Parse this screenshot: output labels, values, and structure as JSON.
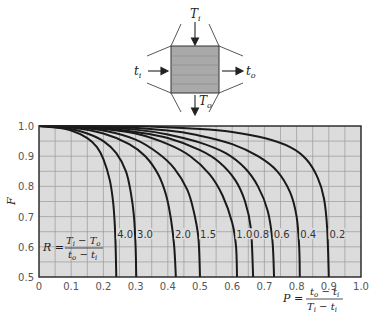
{
  "diagram": {
    "hot_in": "T",
    "hot_in_sub": "i",
    "hot_out": "T",
    "hot_out_sub": "o",
    "cold_in": "t",
    "cold_in_sub": "i",
    "cold_out": "t",
    "cold_out_sub": "o"
  },
  "formulas": {
    "R": {
      "lhs": "R =",
      "num": "T",
      "num_sub1": "i",
      "num_mid": " − T",
      "num_sub2": "o",
      "den": "t",
      "den_sub1": "o",
      "den_mid": " − t",
      "den_sub2": "i"
    },
    "P": {
      "lhs": "P =",
      "num": "t",
      "num_sub1": "o",
      "num_mid": " − t",
      "num_sub2": "i",
      "den": "T",
      "den_sub1": "i",
      "den_mid": " − t",
      "den_sub2": "i"
    }
  },
  "chart_data": {
    "type": "line",
    "title": "",
    "xlabel": "P = (t_o − t_i)/(T_i − t_i)",
    "ylabel": "F",
    "xlim": [
      0,
      1.0
    ],
    "ylim": [
      0.5,
      1.0
    ],
    "x_ticks": [
      "0",
      "0.1",
      "0.2",
      "0.3",
      "0.4",
      "0.5",
      "0.6",
      "0.7",
      "0.8",
      "0.9",
      "1.0"
    ],
    "y_ticks": [
      "1.0",
      "0.9",
      "0.8",
      "0.7",
      "0.6",
      "0.5"
    ],
    "grid": true,
    "grid_minor_x": 0.05,
    "grid_minor_y": 0.05,
    "legend_note": "Curves labeled by R = (T_i − T_o)/(t_o − t_i)",
    "series": [
      {
        "name": "4.0",
        "R": 4.0,
        "points": [
          [
            0,
            1.0
          ],
          [
            0.05,
            0.995
          ],
          [
            0.1,
            0.985
          ],
          [
            0.15,
            0.96
          ],
          [
            0.18,
            0.93
          ],
          [
            0.2,
            0.89
          ],
          [
            0.22,
            0.82
          ],
          [
            0.23,
            0.75
          ],
          [
            0.235,
            0.68
          ],
          [
            0.238,
            0.6
          ],
          [
            0.24,
            0.5
          ]
        ]
      },
      {
        "name": "3.0",
        "R": 3.0,
        "points": [
          [
            0,
            1.0
          ],
          [
            0.05,
            0.997
          ],
          [
            0.1,
            0.99
          ],
          [
            0.15,
            0.975
          ],
          [
            0.2,
            0.95
          ],
          [
            0.24,
            0.91
          ],
          [
            0.27,
            0.85
          ],
          [
            0.285,
            0.78
          ],
          [
            0.295,
            0.7
          ],
          [
            0.3,
            0.6
          ],
          [
            0.302,
            0.5
          ]
        ]
      },
      {
        "name": "2.0",
        "R": 2.0,
        "points": [
          [
            0,
            1.0
          ],
          [
            0.1,
            0.995
          ],
          [
            0.2,
            0.975
          ],
          [
            0.28,
            0.94
          ],
          [
            0.33,
            0.9
          ],
          [
            0.37,
            0.84
          ],
          [
            0.395,
            0.77
          ],
          [
            0.41,
            0.69
          ],
          [
            0.42,
            0.6
          ],
          [
            0.425,
            0.5
          ]
        ]
      },
      {
        "name": "1.5",
        "R": 1.5,
        "points": [
          [
            0,
            1.0
          ],
          [
            0.1,
            0.997
          ],
          [
            0.2,
            0.985
          ],
          [
            0.3,
            0.955
          ],
          [
            0.37,
            0.91
          ],
          [
            0.42,
            0.86
          ],
          [
            0.46,
            0.79
          ],
          [
            0.48,
            0.72
          ],
          [
            0.495,
            0.63
          ],
          [
            0.5,
            0.5
          ]
        ]
      },
      {
        "name": "1.0",
        "R": 1.0,
        "points": [
          [
            0,
            1.0
          ],
          [
            0.1,
            0.998
          ],
          [
            0.2,
            0.99
          ],
          [
            0.3,
            0.975
          ],
          [
            0.4,
            0.94
          ],
          [
            0.47,
            0.9
          ],
          [
            0.53,
            0.84
          ],
          [
            0.57,
            0.77
          ],
          [
            0.6,
            0.68
          ],
          [
            0.612,
            0.6
          ],
          [
            0.615,
            0.5
          ]
        ]
      },
      {
        "name": "0.8",
        "R": 0.8,
        "points": [
          [
            0,
            1.0
          ],
          [
            0.1,
            0.999
          ],
          [
            0.2,
            0.993
          ],
          [
            0.3,
            0.98
          ],
          [
            0.4,
            0.96
          ],
          [
            0.5,
            0.92
          ],
          [
            0.56,
            0.88
          ],
          [
            0.61,
            0.82
          ],
          [
            0.64,
            0.75
          ],
          [
            0.658,
            0.66
          ],
          [
            0.665,
            0.5
          ]
        ]
      },
      {
        "name": "0.6",
        "R": 0.6,
        "points": [
          [
            0,
            1.0
          ],
          [
            0.2,
            0.995
          ],
          [
            0.3,
            0.988
          ],
          [
            0.4,
            0.972
          ],
          [
            0.5,
            0.945
          ],
          [
            0.58,
            0.91
          ],
          [
            0.64,
            0.86
          ],
          [
            0.68,
            0.8
          ],
          [
            0.71,
            0.72
          ],
          [
            0.725,
            0.62
          ],
          [
            0.73,
            0.5
          ]
        ]
      },
      {
        "name": "0.4",
        "R": 0.4,
        "points": [
          [
            0,
            1.0
          ],
          [
            0.2,
            0.998
          ],
          [
            0.4,
            0.985
          ],
          [
            0.5,
            0.968
          ],
          [
            0.6,
            0.94
          ],
          [
            0.68,
            0.9
          ],
          [
            0.74,
            0.85
          ],
          [
            0.78,
            0.78
          ],
          [
            0.8,
            0.7
          ],
          [
            0.808,
            0.6
          ],
          [
            0.81,
            0.5
          ]
        ]
      },
      {
        "name": "0.2",
        "R": 0.2,
        "points": [
          [
            0,
            1.0
          ],
          [
            0.3,
            0.999
          ],
          [
            0.5,
            0.99
          ],
          [
            0.6,
            0.98
          ],
          [
            0.7,
            0.96
          ],
          [
            0.78,
            0.93
          ],
          [
            0.83,
            0.89
          ],
          [
            0.865,
            0.83
          ],
          [
            0.885,
            0.76
          ],
          [
            0.895,
            0.66
          ],
          [
            0.9,
            0.5
          ]
        ]
      }
    ]
  }
}
